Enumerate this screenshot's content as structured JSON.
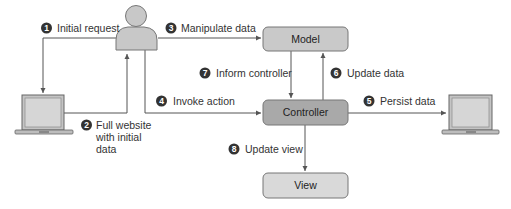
{
  "diagram": {
    "colors": {
      "line": "#555555",
      "model_fill": "#c9c9c9",
      "controller_fill": "#a9a9a9",
      "view_fill": "#d9d9d9",
      "badge": "#333333",
      "user_fill": "#c8c8c8",
      "laptop_screen": "#d0d0d0"
    },
    "nodes": {
      "user": {
        "icon": "user-icon"
      },
      "client_laptop": {
        "icon": "laptop-icon"
      },
      "server_laptop": {
        "icon": "laptop-icon"
      },
      "model": {
        "label": "Model"
      },
      "controller": {
        "label": "Controller"
      },
      "view": {
        "label": "View"
      }
    },
    "steps": [
      {
        "num": "1",
        "label": "Initial request"
      },
      {
        "num": "2",
        "label_lines": [
          "Full website",
          "with initial",
          "data"
        ]
      },
      {
        "num": "3",
        "label": "Manipulate data"
      },
      {
        "num": "4",
        "label": "Invoke action"
      },
      {
        "num": "5",
        "label": "Persist data"
      },
      {
        "num": "6",
        "label": "Update data"
      },
      {
        "num": "7",
        "label": "Inform controller"
      },
      {
        "num": "8",
        "label": "Update view"
      }
    ]
  }
}
